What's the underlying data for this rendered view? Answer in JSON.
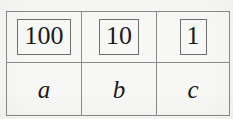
{
  "figure": {
    "kind": "place-value-table",
    "background_color": "#f7f7f5",
    "border_color": "#8a8a8a",
    "text_color": "#1a1a1a"
  },
  "table": {
    "columns": [
      "hundreds",
      "tens",
      "ones"
    ],
    "rows": [
      {
        "name": "place-values",
        "style": "boxed-number",
        "cells": [
          "100",
          "10",
          "1"
        ]
      },
      {
        "name": "digit-letters",
        "style": "italic-letter",
        "cells": [
          "a",
          "b",
          "c"
        ]
      }
    ]
  }
}
